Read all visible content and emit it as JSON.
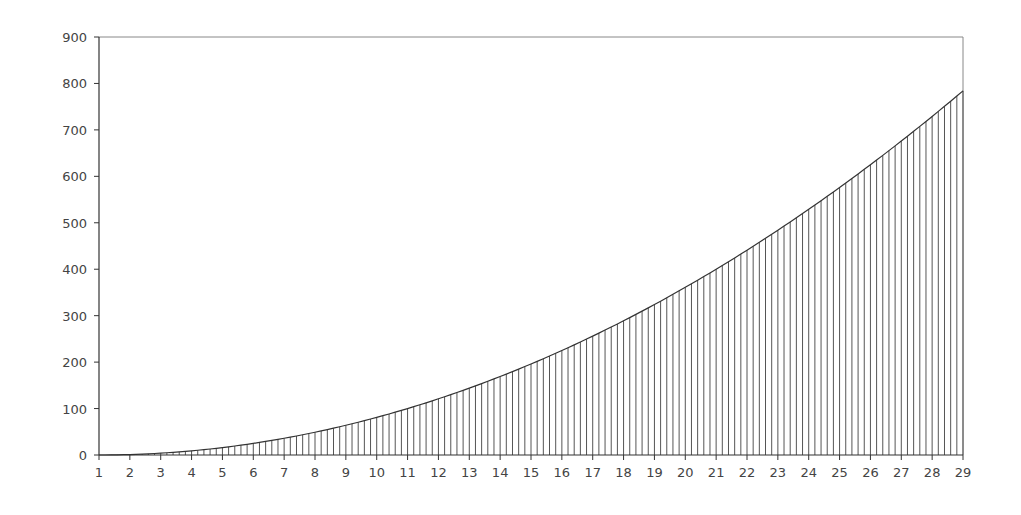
{
  "chart_data": {
    "type": "area",
    "title": "",
    "xlabel": "",
    "ylabel": "",
    "x_ticks": [
      1,
      2,
      3,
      4,
      5,
      6,
      7,
      8,
      9,
      10,
      11,
      12,
      13,
      14,
      15,
      16,
      17,
      18,
      19,
      20,
      21,
      22,
      23,
      24,
      25,
      26,
      27,
      28,
      29
    ],
    "y_ticks": [
      0,
      100,
      200,
      300,
      400,
      500,
      600,
      700,
      800,
      900
    ],
    "xlim": [
      1,
      29
    ],
    "ylim": [
      0,
      900
    ],
    "sample_step": 0.2,
    "formula": "y = (x - 1)^2",
    "x": [
      1,
      2,
      3,
      4,
      5,
      6,
      7,
      8,
      9,
      10,
      11,
      12,
      13,
      14,
      15,
      16,
      17,
      18,
      19,
      20,
      21,
      22,
      23,
      24,
      25,
      26,
      27,
      28,
      29
    ],
    "values": [
      0,
      1,
      4,
      9,
      16,
      25,
      36,
      49,
      64,
      81,
      100,
      121,
      144,
      169,
      196,
      225,
      256,
      289,
      324,
      361,
      400,
      441,
      484,
      529,
      576,
      625,
      676,
      729,
      784
    ],
    "grid": false,
    "legend": "none",
    "fill_style": "vertical-hatch",
    "colors": {
      "line": "#333333",
      "hatch": "#555555",
      "axis": "#333333",
      "frame": "#888888",
      "text": "#444444"
    }
  }
}
